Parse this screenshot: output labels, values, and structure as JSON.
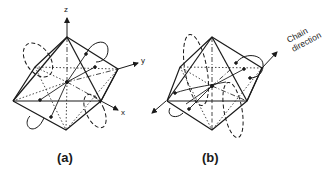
{
  "figure": {
    "panels": [
      {
        "id": "a",
        "label": "(a)",
        "axes": {
          "z": "z",
          "y": "y",
          "x": "x"
        }
      },
      {
        "id": "b",
        "label": "(b)",
        "annotation": {
          "line1": "Chain",
          "line2": "direction"
        }
      }
    ],
    "colors": {
      "ink": "#1a1a1a",
      "background": "#ffffff"
    }
  }
}
